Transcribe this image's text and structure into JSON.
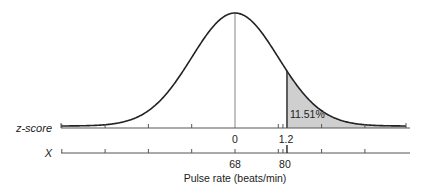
{
  "chart_data": {
    "type": "area",
    "title": "",
    "distribution": "normal",
    "mean": 68,
    "sd": 10,
    "shaded_region": {
      "from_z": 1.2,
      "to_z": "inf",
      "label": "11.51%"
    },
    "z_axis": {
      "name": "z-score",
      "tick_labels": [
        {
          "z": 0,
          "label": "0"
        },
        {
          "z": 1.2,
          "label": "1.2"
        }
      ],
      "range": [
        -4,
        4
      ]
    },
    "x_axis": {
      "name": "X",
      "tick_labels": [
        {
          "x": 68,
          "label": "68"
        },
        {
          "x": 80,
          "label": "80"
        }
      ],
      "xlabel": "Pulse rate (beats/min)"
    },
    "colors": {
      "shade": "#cfcfcf",
      "curve": "#222222",
      "axis": "#555555",
      "mean_line": "#999999"
    }
  }
}
